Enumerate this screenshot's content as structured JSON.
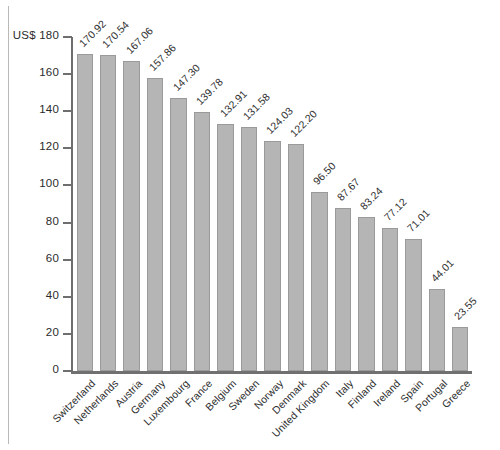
{
  "chart_data": {
    "type": "bar",
    "title": "",
    "subtitle": "",
    "xlabel": "",
    "ylabel": "US$",
    "ylim": [
      0,
      180
    ],
    "ytick_step": 20,
    "yticks": [
      0,
      20,
      40,
      60,
      80,
      100,
      120,
      140,
      160,
      180
    ],
    "ytick_labels": [
      "0",
      "20",
      "40",
      "60",
      "80",
      "100",
      "120",
      "140",
      "160",
      "US$ 180"
    ],
    "grid": false,
    "legend": null,
    "categories": [
      "Switzerland",
      "Netherlands",
      "Austria",
      "Germany",
      "Luxembourg",
      "France",
      "Belgium",
      "Sweden",
      "Norway",
      "Denmark",
      "United Kingdom",
      "Italy",
      "Finland",
      "Ireland",
      "Spain",
      "Portugal",
      "Greece"
    ],
    "values": [
      170.92,
      170.54,
      167.06,
      157.86,
      147.3,
      139.78,
      132.91,
      131.58,
      124.03,
      122.2,
      96.5,
      87.67,
      83.24,
      77.12,
      71.01,
      44.01,
      23.55
    ],
    "value_labels": [
      "170.92",
      "170.54",
      "167.06",
      "157.86",
      "147.30",
      "139.78",
      "132.91",
      "131.58",
      "124.03",
      "122.20",
      "96.50",
      "87.67",
      "83.24",
      "77.12",
      "71.01",
      "44.01",
      "23.55"
    ],
    "colors": {
      "bar_fill": "#b5b5b5",
      "bar_stroke": "#9a9a9a",
      "axis": "#6e6e6e",
      "text": "#2e2e2e",
      "background": "#ffffff"
    }
  }
}
